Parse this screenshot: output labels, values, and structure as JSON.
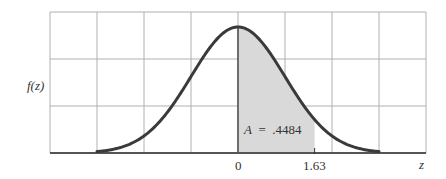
{
  "chart_data": {
    "type": "area",
    "title": "",
    "xlabel": "z",
    "ylabel": "f(z)",
    "curve": "standard normal pdf",
    "x_range": [
      -3,
      3
    ],
    "x_ticks": [
      {
        "value": 0,
        "label": "0"
      },
      {
        "value": 1.63,
        "label": "1.63"
      }
    ],
    "shaded_region": {
      "from": 0,
      "to": 1.63,
      "area": 0.4484
    },
    "annotation": "A  =  .4484",
    "grid": {
      "on": true,
      "columns": 8,
      "rows": 3
    },
    "colors": {
      "curve": "#3a3a3a",
      "shade": "#d9d9d9",
      "grid": "#b0b0b0",
      "axis": "#555555"
    }
  },
  "labels": {
    "ylabel": "f(z)",
    "xlabel": "z",
    "tick_zero": "0",
    "tick_163": "1.63",
    "annotation": "A  =  .4484"
  }
}
